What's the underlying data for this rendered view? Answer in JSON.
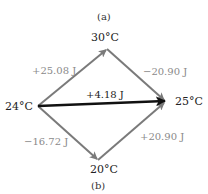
{
  "captions": {
    "top": "(a)",
    "bottom": "(b)"
  },
  "nodes": {
    "top": "30°C",
    "left": "24°C",
    "right": "25°C",
    "bottom": "20°C"
  },
  "edges": {
    "left_to_top": "+25.08 J",
    "top_to_right": "−20.90 J",
    "left_to_right": "+4.18 J",
    "left_to_bottom": "−16.72 J",
    "bottom_to_right": "+20.90 J"
  },
  "colors": {
    "gray_arrow": "#7a7a7a",
    "direct_arrow": "#111111",
    "gray_text": "#8a8a8a"
  }
}
